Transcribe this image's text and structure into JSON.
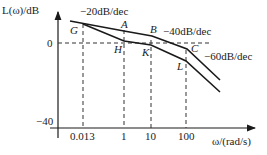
{
  "diagram": {
    "type": "bode-magnitude-asymptotic",
    "y_axis_label": "L(ω)/dB",
    "x_axis_label": "ω/(rad/s)",
    "y_ticks": [
      "0",
      "−40"
    ],
    "x_ticks": [
      "0.013",
      "1",
      "10",
      "100"
    ],
    "slopes": {
      "s1": "−20dB/dec",
      "s2": "−40dB/dec",
      "s3": "−60dB/dec"
    },
    "points": {
      "G": "G",
      "A": "A",
      "B": "B",
      "C": "C",
      "H": "H",
      "K": "K",
      "L": "L"
    },
    "colors": {
      "line": "#1a1a1a",
      "dash": "#333333"
    }
  }
}
